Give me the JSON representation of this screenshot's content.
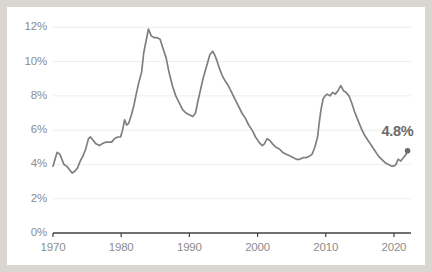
{
  "chart_data": {
    "type": "line",
    "title": "",
    "subtitle": "",
    "xlabel": "",
    "ylabel": "",
    "xlim": [
      1970,
      2022.5
    ],
    "ylim": [
      0,
      12.6
    ],
    "grid": true,
    "legend_position": "none",
    "xticks": [
      "1970",
      "1980",
      "1990",
      "2000",
      "2010",
      "2020"
    ],
    "xtick_values": [
      1970,
      1980,
      1990,
      2000,
      2010,
      2020
    ],
    "yticks": [
      "0%",
      "2%",
      "4%",
      "6%",
      "8%",
      "10%",
      "12%"
    ],
    "ytick_values": [
      0,
      2,
      4,
      6,
      8,
      10,
      12
    ],
    "line_color": "#7f7f7f",
    "grid_color": "#ededed",
    "axis_color": "#404040",
    "end_marker": {
      "x": 2022.0,
      "y": 4.8,
      "label": "4.8%",
      "color": "#6b6b6b"
    },
    "series": [
      {
        "name": "Unemployment rate",
        "color": "#7f7f7f",
        "x": [
          1970.0,
          1970.3,
          1970.6,
          1971.0,
          1971.3,
          1971.6,
          1972.0,
          1972.4,
          1972.8,
          1973.2,
          1973.6,
          1974.0,
          1974.4,
          1974.8,
          1975.0,
          1975.2,
          1975.5,
          1975.9,
          1976.3,
          1976.8,
          1977.2,
          1977.7,
          1978.1,
          1978.6,
          1979.0,
          1979.5,
          1979.9,
          1980.2,
          1980.5,
          1980.8,
          1981.1,
          1981.5,
          1981.9,
          1982.2,
          1982.6,
          1983.0,
          1983.3,
          1983.7,
          1984.0,
          1984.4,
          1984.8,
          1985.2,
          1985.7,
          1986.1,
          1986.6,
          1987.0,
          1987.5,
          1988.0,
          1988.5,
          1989.0,
          1989.5,
          1990.0,
          1990.5,
          1990.9,
          1991.2,
          1991.6,
          1992.0,
          1992.5,
          1993.0,
          1993.4,
          1993.7,
          1994.0,
          1994.4,
          1994.8,
          1995.2,
          1995.7,
          1996.2,
          1996.7,
          1997.2,
          1997.7,
          1998.2,
          1998.7,
          1999.2,
          1999.7,
          2000.2,
          2000.7,
          2001.0,
          2001.4,
          2001.8,
          2002.2,
          2002.7,
          2003.2,
          2003.7,
          2004.2,
          2004.7,
          2005.2,
          2005.7,
          2006.2,
          2006.7,
          2007.2,
          2007.7,
          2008.0,
          2008.4,
          2008.8,
          2009.0,
          2009.3,
          2009.6,
          2009.9,
          2010.2,
          2010.6,
          2011.0,
          2011.4,
          2011.8,
          2012.2,
          2012.6,
          2013.0,
          2013.4,
          2013.8,
          2014.2,
          2014.7,
          2015.2,
          2015.7,
          2016.2,
          2016.7,
          2017.2,
          2017.7,
          2018.2,
          2018.7,
          2019.2,
          2019.7,
          2020.0,
          2020.3,
          2020.6,
          2021.0,
          2021.4,
          2021.8,
          2022.0
        ],
        "y": [
          3.9,
          4.3,
          4.7,
          4.6,
          4.3,
          4.0,
          3.9,
          3.7,
          3.5,
          3.6,
          3.8,
          4.2,
          4.5,
          4.9,
          5.2,
          5.5,
          5.6,
          5.4,
          5.2,
          5.1,
          5.2,
          5.3,
          5.3,
          5.3,
          5.5,
          5.6,
          5.6,
          6.0,
          6.6,
          6.3,
          6.4,
          6.9,
          7.5,
          8.1,
          8.8,
          9.4,
          10.5,
          11.3,
          11.9,
          11.5,
          11.4,
          11.4,
          11.3,
          10.8,
          10.2,
          9.4,
          8.6,
          8.0,
          7.6,
          7.2,
          7.0,
          6.9,
          6.8,
          7.0,
          7.6,
          8.3,
          9.0,
          9.7,
          10.4,
          10.6,
          10.4,
          10.1,
          9.6,
          9.2,
          8.9,
          8.6,
          8.2,
          7.8,
          7.4,
          7.0,
          6.7,
          6.3,
          6.0,
          5.6,
          5.3,
          5.1,
          5.2,
          5.5,
          5.4,
          5.2,
          5.0,
          4.9,
          4.7,
          4.6,
          4.5,
          4.4,
          4.3,
          4.3,
          4.4,
          4.4,
          4.5,
          4.6,
          5.0,
          5.6,
          6.3,
          7.2,
          7.8,
          8.0,
          8.1,
          8.0,
          8.2,
          8.1,
          8.3,
          8.6,
          8.3,
          8.2,
          8.0,
          7.6,
          7.1,
          6.6,
          6.1,
          5.7,
          5.4,
          5.1,
          4.8,
          4.5,
          4.3,
          4.1,
          4.0,
          3.9,
          3.9,
          4.0,
          4.3,
          4.2,
          4.4,
          4.6,
          4.8
        ]
      }
    ]
  },
  "callout": {
    "value_label": "4.8%"
  }
}
